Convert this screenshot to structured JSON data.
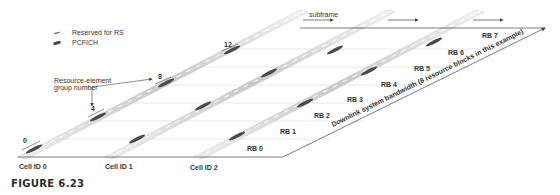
{
  "legend": {
    "items": [
      {
        "label": "Reserved for RS",
        "icon": "rs-marker-icon"
      },
      {
        "label": "PCFICH",
        "icon": "pcfich-marker-icon"
      }
    ]
  },
  "annotations": {
    "subframe": "subframe",
    "reg_label_line1": "Resource-element",
    "reg_label_line2": "group number",
    "reg_numbers": [
      "0",
      "4",
      "8",
      "12"
    ],
    "bandwidth": "Downlink system bandwidth (8 resource blocks in this example)"
  },
  "cells": [
    {
      "label": "Cell ID  0"
    },
    {
      "label": "Cell ID 1"
    },
    {
      "label": "Cell ID 2"
    }
  ],
  "resource_blocks": [
    "RB 0",
    "RB 1",
    "RB 2",
    "RB 3",
    "RB 4",
    "RB 5",
    "RB 6",
    "RB 7"
  ],
  "caption": "FIGURE 6.23",
  "colors": {
    "line": "#444444",
    "grid": "#d8d8d8",
    "strip": "#cfcfcf",
    "pcfich": "#555555"
  }
}
